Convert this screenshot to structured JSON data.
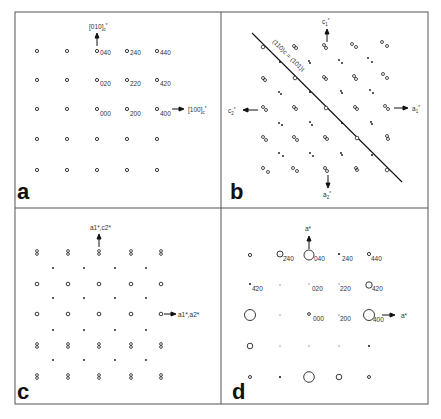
{
  "figure": {
    "colors": {
      "ink": "#222222",
      "frame": "#555555",
      "label": "#333333",
      "background": "#ffffff"
    },
    "panels": [
      {
        "id": "a",
        "letter": "a",
        "arrows": [
          {
            "direction": "up",
            "label": "[010]",
            "subscript": "c",
            "superscript": "*"
          },
          {
            "direction": "right",
            "label": "[100]",
            "subscript": "c",
            "superscript": "*"
          }
        ],
        "spot_labels": [
          "040",
          "240",
          "440",
          "020",
          "220",
          "420",
          "000",
          "200",
          "400"
        ]
      },
      {
        "id": "b",
        "letter": "b",
        "arrows": [
          {
            "direction": "up",
            "label": "c",
            "subscript": "1",
            "superscript": "*"
          },
          {
            "direction": "right",
            "label": "a",
            "subscript": "1",
            "superscript": "*"
          },
          {
            "direction": "left",
            "label": "c",
            "subscript": "2",
            "superscript": "*"
          },
          {
            "direction": "down",
            "label": "a",
            "subscript": "2",
            "superscript": "*"
          }
        ],
        "mirror_line_label": "(110)c = (101)t"
      },
      {
        "id": "c",
        "letter": "c",
        "arrows": [
          {
            "direction": "up",
            "label": "a1*,c2*"
          },
          {
            "direction": "right",
            "label": "a1*,a2*"
          }
        ]
      },
      {
        "id": "d",
        "letter": "d",
        "arrows": [
          {
            "direction": "up",
            "label": "a*"
          },
          {
            "direction": "right",
            "label": "a*"
          }
        ],
        "spot_labels": [
          "2̄40",
          "040",
          "240",
          "440",
          "4̄20",
          "020",
          "220",
          "420",
          "000",
          "200",
          "400"
        ]
      }
    ]
  }
}
